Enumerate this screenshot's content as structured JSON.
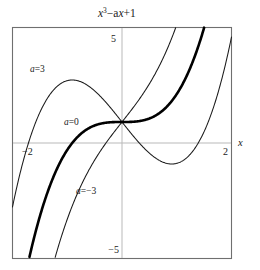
{
  "chart_data": {
    "type": "line",
    "title_parts": {
      "base": "x",
      "exponent": "3",
      "rest": "−a",
      "var2": "x",
      "tail": "+1"
    },
    "xlabel": "x",
    "ylabel": "",
    "xlim": [
      -2.2,
      2.2
    ],
    "ylim": [
      -5.5,
      5.5
    ],
    "grid": false,
    "legend_position": "inline-annotations",
    "x_ticks": [
      {
        "value": -2,
        "label": "−2"
      },
      {
        "value": 2,
        "label": "2"
      }
    ],
    "y_ticks": [
      {
        "value": 5,
        "label": "5"
      },
      {
        "value": -5,
        "label": "−5"
      }
    ],
    "formula": "y = x^3 - a*x + 1",
    "series": [
      {
        "name": "a=3",
        "a": 3,
        "label": "a",
        "label_eq": "=3",
        "emphasis": "normal",
        "x": [
          -2.2,
          -2.0,
          -1.8,
          -1.6,
          -1.4,
          -1.2,
          -1.0,
          -0.8,
          -0.6,
          -0.4,
          -0.2,
          0.0,
          0.2,
          0.4,
          0.6,
          0.8,
          1.0,
          1.2,
          1.4,
          1.6,
          1.8,
          2.0,
          2.2
        ],
        "values": [
          -3.048,
          -1.0,
          0.568,
          1.704,
          2.456,
          2.872,
          3.0,
          2.888,
          2.584,
          2.136,
          1.592,
          1.0,
          0.408,
          -0.136,
          -0.584,
          -0.888,
          -1.0,
          -0.872,
          -0.456,
          0.296,
          1.432,
          3.0,
          5.048
        ]
      },
      {
        "name": "a=0",
        "a": 0,
        "label": "a",
        "label_eq": "=0",
        "emphasis": "bold",
        "x": [
          -2.2,
          -2.0,
          -1.8,
          -1.6,
          -1.4,
          -1.2,
          -1.0,
          -0.8,
          -0.6,
          -0.4,
          -0.2,
          0.0,
          0.2,
          0.4,
          0.6,
          0.8,
          1.0,
          1.2,
          1.4,
          1.6,
          1.8,
          2.0,
          2.2
        ],
        "values": [
          -9.648,
          -7.0,
          -4.832,
          -3.096,
          -1.744,
          -0.728,
          0.0,
          0.488,
          0.784,
          0.936,
          0.992,
          1.0,
          1.008,
          1.064,
          1.216,
          1.512,
          2.0,
          2.728,
          3.744,
          5.096,
          6.832,
          9.0,
          11.648
        ]
      },
      {
        "name": "a=-3",
        "a": -3,
        "label": "a",
        "label_eq": "=−3",
        "emphasis": "normal",
        "x": [
          -2.2,
          -2.0,
          -1.8,
          -1.6,
          -1.4,
          -1.2,
          -1.0,
          -0.8,
          -0.6,
          -0.4,
          -0.2,
          0.0,
          0.2,
          0.4,
          0.6,
          0.8,
          1.0,
          1.2,
          1.4,
          1.6,
          1.8,
          2.0,
          2.2
        ],
        "values": [
          -16.248,
          -13.0,
          -10.232,
          -7.896,
          -5.944,
          -4.328,
          -3.0,
          -1.912,
          -1.016,
          -0.264,
          0.392,
          1.0,
          1.608,
          2.264,
          3.016,
          3.912,
          5.0,
          6.328,
          7.944,
          9.896,
          12.232,
          15.0,
          18.248
        ]
      }
    ],
    "annotations": [
      {
        "text_var": "a",
        "text_eq": "=3",
        "x": -1.45,
        "y": 3.6
      },
      {
        "text_var": "a",
        "text_eq": "=0",
        "x": -0.92,
        "y": 0.95
      },
      {
        "text_var": "a",
        "text_eq": "=−3",
        "x": -0.62,
        "y": -1.95
      }
    ],
    "colors": {
      "curve": "#1a1a1a",
      "frame": "#6f6f6f",
      "axis": "#b9b9b9",
      "background": "#ffffff"
    }
  }
}
